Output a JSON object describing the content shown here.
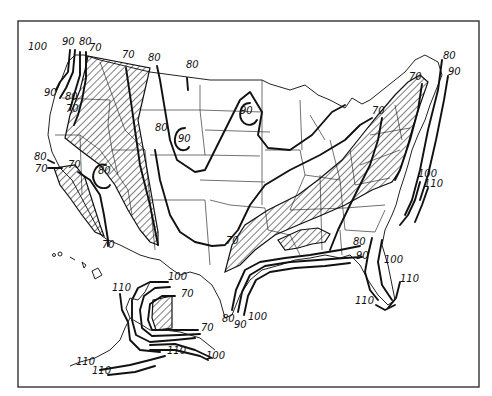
{
  "map": {
    "type": "isopleth-map",
    "region": "United States (contiguous, Alaska, Hawaii)",
    "legend": {
      "hatched_region": "shaded area"
    },
    "contour_labels": [
      {
        "id": "nw-100",
        "text": "100",
        "x": 47,
        "y": 50
      },
      {
        "id": "nw-90a",
        "text": "90",
        "x": 66,
        "y": 42
      },
      {
        "id": "nw-80a",
        "text": "80",
        "x": 81,
        "y": 42
      },
      {
        "id": "nw-70a",
        "text": "70",
        "x": 89,
        "y": 50
      },
      {
        "id": "nw-90b",
        "text": "90",
        "x": 45,
        "y": 95
      },
      {
        "id": "nw-80b",
        "text": "80",
        "x": 66,
        "y": 97
      },
      {
        "id": "nw-70b",
        "text": "70",
        "x": 66,
        "y": 110
      },
      {
        "id": "mt-70",
        "text": "70",
        "x": 124,
        "y": 56
      },
      {
        "id": "mt-80",
        "text": "80",
        "x": 150,
        "y": 59
      },
      {
        "id": "nd-80",
        "text": "80",
        "x": 187,
        "y": 66
      },
      {
        "id": "co-80",
        "text": "80",
        "x": 156,
        "y": 128
      },
      {
        "id": "co-90",
        "text": "90",
        "x": 179,
        "y": 139
      },
      {
        "id": "sd-90",
        "text": "90",
        "x": 243,
        "y": 112
      },
      {
        "id": "ca-80",
        "text": "80",
        "x": 34,
        "y": 159
      },
      {
        "id": "ca-70a",
        "text": "70",
        "x": 34,
        "y": 172
      },
      {
        "id": "ca-70b",
        "text": "70",
        "x": 68,
        "y": 166
      },
      {
        "id": "nv-80",
        "text": "80",
        "x": 97,
        "y": 172
      },
      {
        "id": "ca-70c",
        "text": "70",
        "x": 101,
        "y": 247
      },
      {
        "id": "tx-70",
        "text": "70",
        "x": 227,
        "y": 242
      },
      {
        "id": "ne-70a",
        "text": "70",
        "x": 409,
        "y": 78
      },
      {
        "id": "ne-80",
        "text": "80",
        "x": 443,
        "y": 57
      },
      {
        "id": "ne-90",
        "text": "90",
        "x": 448,
        "y": 73
      },
      {
        "id": "mi-70",
        "text": "70",
        "x": 372,
        "y": 112
      },
      {
        "id": "ec-100a",
        "text": "100",
        "x": 418,
        "y": 176
      },
      {
        "id": "ec-110a",
        "text": "110",
        "x": 424,
        "y": 186
      },
      {
        "id": "se-80",
        "text": "80",
        "x": 355,
        "y": 243
      },
      {
        "id": "se-90",
        "text": "90",
        "x": 357,
        "y": 258
      },
      {
        "id": "fl-100",
        "text": "100",
        "x": 386,
        "y": 261
      },
      {
        "id": "fl-110a",
        "text": "110",
        "x": 401,
        "y": 281
      },
      {
        "id": "fl-110b",
        "text": "110",
        "x": 357,
        "y": 303
      },
      {
        "id": "gulf-80",
        "text": "80",
        "x": 226,
        "y": 320
      },
      {
        "id": "gulf-90",
        "text": "90",
        "x": 235,
        "y": 326
      },
      {
        "id": "gulf-100",
        "text": "100",
        "x": 248,
        "y": 318
      },
      {
        "id": "ak-100a",
        "text": "100",
        "x": 168,
        "y": 279
      },
      {
        "id": "ak-110a",
        "text": "110",
        "x": 112,
        "y": 289
      },
      {
        "id": "ak-70a",
        "text": "70",
        "x": 180,
        "y": 295
      },
      {
        "id": "ak-70b",
        "text": "70",
        "x": 201,
        "y": 330
      },
      {
        "id": "ak-110b",
        "text": "110",
        "x": 167,
        "y": 352
      },
      {
        "id": "ak-100b",
        "text": "100",
        "x": 209,
        "y": 358
      },
      {
        "id": "ak-110c",
        "text": "110",
        "x": 78,
        "y": 364
      },
      {
        "id": "ak-110d",
        "text": "110",
        "x": 94,
        "y": 373
      }
    ]
  }
}
